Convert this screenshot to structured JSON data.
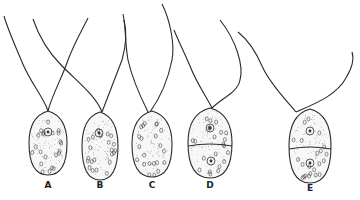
{
  "figure": {
    "kind": "scientific-illustration",
    "ink_color": "#2a2a2a",
    "background": "#ffffff",
    "cells": [
      {
        "label": "A",
        "cx": 48,
        "cy": 143,
        "rx": 19,
        "ry": 32,
        "divided": false,
        "nuclei": [
          [
            48,
            132
          ]
        ],
        "flagella": [
          "M48,111 C44,98 30,82 22,62 C15,45 8,30 4,16",
          "M48,111 C52,95 62,78 68,60 C74,44 82,30 88,18"
        ]
      },
      {
        "label": "B",
        "cx": 100,
        "cy": 146,
        "rx": 18,
        "ry": 34,
        "divided": false,
        "nuclei": [
          [
            99,
            133
          ]
        ],
        "flagella": [
          "M102,112 C96,96 78,82 62,66 C48,52 38,34 33,19",
          "M102,112 C108,96 116,76 122,60 C126,46 127,32 124,20"
        ]
      },
      {
        "label": "C",
        "cx": 152,
        "cy": 144,
        "rx": 20,
        "ry": 33,
        "divided": false,
        "nuclei": [],
        "flagella": [
          "M148,112 C140,96 132,78 128,60 C125,44 126,28 123,14",
          "M150,112 C160,98 168,80 172,60 C175,44 170,20 162,4"
        ]
      },
      {
        "label": "D",
        "cx": 210,
        "cy": 143,
        "rx": 22,
        "ry": 35,
        "divided": true,
        "division_y": 146,
        "nuclei": [
          [
            210,
            128
          ],
          [
            211,
            161
          ]
        ],
        "flagella": [
          "M212,108 C206,96 196,82 190,66 C184,52 178,40 174,30",
          "M212,108 C222,98 238,92 240,80 C244,66 236,40 220,20"
        ]
      },
      {
        "label": "E",
        "cx": 310,
        "cy": 146,
        "rx": 21,
        "ry": 37,
        "divided": true,
        "division_y": 149,
        "nuclei": [
          [
            310,
            131
          ],
          [
            310,
            163
          ]
        ],
        "flagella": [
          "M296,112 C286,100 270,84 262,66 C256,52 248,40 238,32",
          "M296,112 C314,104 336,96 346,78 C352,68 354,58 352,52"
        ]
      }
    ]
  }
}
